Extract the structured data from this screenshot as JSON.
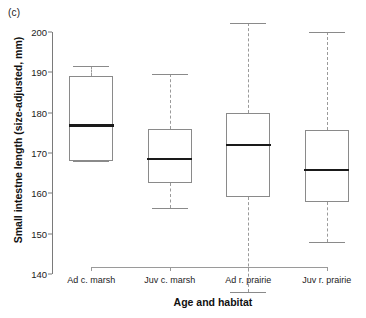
{
  "panel": {
    "label": "(c)"
  },
  "chart_data": {
    "type": "box",
    "title": "",
    "xlabel": "Age and habitat",
    "ylabel": "Small intestne length (size-adjusted, mm)",
    "ylim": [
      138,
      204
    ],
    "ytick_values": [
      140,
      150,
      160,
      170,
      180,
      190,
      200
    ],
    "ytick_labels": [
      "140",
      "150",
      "160",
      "170",
      "180",
      "190",
      "200"
    ],
    "grid": false,
    "legend": "none",
    "categories": [
      "Ad c. marsh",
      "Juv c. marsh",
      "Ad r. prairie",
      "Juv r. prairie"
    ],
    "boxes": [
      {
        "category": "Ad c. marsh",
        "whisker_low": 168.0,
        "q1": 168.0,
        "median": 176.8,
        "q3": 189.0,
        "whisker_high": 191.5
      },
      {
        "category": "Juv c. marsh",
        "whisker_low": 156.3,
        "q1": 162.5,
        "median": 168.5,
        "q3": 176.0,
        "whisker_high": 189.5
      },
      {
        "category": "Ad r. prairie",
        "whisker_low": 135.5,
        "q1": 159.0,
        "median": 172.0,
        "q3": 180.0,
        "whisker_high": 202.3
      },
      {
        "category": "Juv r. prairie",
        "whisker_low": 148.0,
        "q1": 157.8,
        "median": 165.8,
        "q3": 175.8,
        "whisker_high": 200.0
      }
    ],
    "colors": {
      "box_border": "#8a8a8a",
      "median": "#1a1a1a",
      "whisker": "#9a9a9a",
      "axis": "#7a7a7a",
      "text": "#111111"
    }
  }
}
